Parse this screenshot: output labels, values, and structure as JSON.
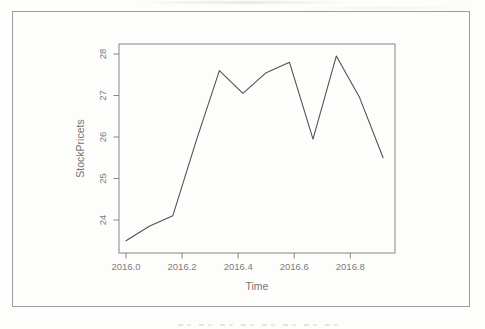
{
  "page": {
    "background_color": "#fdfdfb",
    "frame_color": "#9b9b9b"
  },
  "chart_data": {
    "type": "line",
    "title": "",
    "xlabel": "Time",
    "ylabel": "StockPricets",
    "x": [
      2016.0,
      2016.083,
      2016.167,
      2016.25,
      2016.333,
      2016.417,
      2016.5,
      2016.583,
      2016.667,
      2016.75,
      2016.833,
      2016.917
    ],
    "values": [
      23.5,
      23.85,
      24.1,
      25.9,
      27.6,
      27.05,
      27.55,
      27.8,
      25.95,
      27.95,
      26.95,
      25.5
    ],
    "x_ticks": [
      2016.0,
      2016.2,
      2016.4,
      2016.6,
      2016.8
    ],
    "x_tick_labels": [
      "2016.0",
      "2016.2",
      "2016.4",
      "2016.6",
      "2016.8"
    ],
    "y_ticks": [
      24,
      25,
      26,
      27,
      28
    ],
    "y_tick_labels": [
      "24",
      "25",
      "26",
      "27",
      "28"
    ],
    "xlim": [
      2015.963,
      2016.954
    ],
    "ylim": [
      23.27,
      28.13
    ],
    "grid": false,
    "legend": "none",
    "line_color": "#525252",
    "axis_color": "#868686",
    "text_color": "#7c7c7c"
  }
}
